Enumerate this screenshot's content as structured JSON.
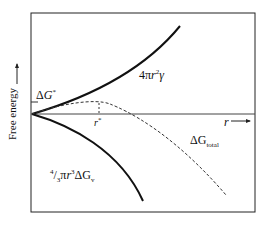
{
  "diagram": {
    "ylabel": "Free energy",
    "xlabel": "r",
    "labels": {
      "surface_term": "4πr²γ",
      "surface_term_parts": {
        "pre": "4π",
        "var": "r",
        "sup": "2",
        "post": "γ"
      },
      "volume_term_parts": {
        "frac": "4/3",
        "pi": "π",
        "var": "r",
        "sup": "3",
        "dg": "ΔG",
        "sub": "v"
      },
      "critical_barrier": "ΔG*",
      "critical_radius": "r*",
      "total_parts": {
        "dg": "ΔG",
        "sub": "total"
      }
    },
    "colors": {
      "line": "#111111",
      "dashed": "#333333"
    }
  }
}
